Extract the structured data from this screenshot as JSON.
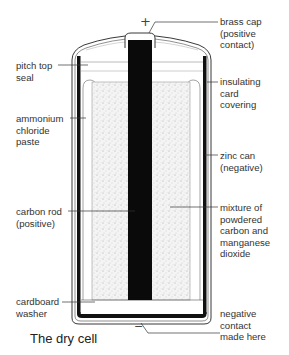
{
  "title": "The dry cell",
  "terminals": {
    "positive_symbol": "+",
    "negative_symbol": "−"
  },
  "labels": {
    "brass_cap": "brass cap\n(positive\ncontact)",
    "pitch_top_seal": "pitch top\nseal",
    "insulating_card": "insulating\ncard\ncovering",
    "ammonium_chloride": "ammonium\nchloride\npaste",
    "zinc_can": "zinc can\n(negative)",
    "carbon_rod": "carbon rod\n(positive)",
    "mixture": "mixture of\npowdered\ncarbon and\nmanganese\ndioxide",
    "cardboard_washer": "cardboard\nwasher",
    "negative_contact": "negative\ncontact\nmade here"
  },
  "colors": {
    "ink": "#111111",
    "label_text": "#333333",
    "paste_fill": "#f3f3f3",
    "background": "#ffffff"
  }
}
